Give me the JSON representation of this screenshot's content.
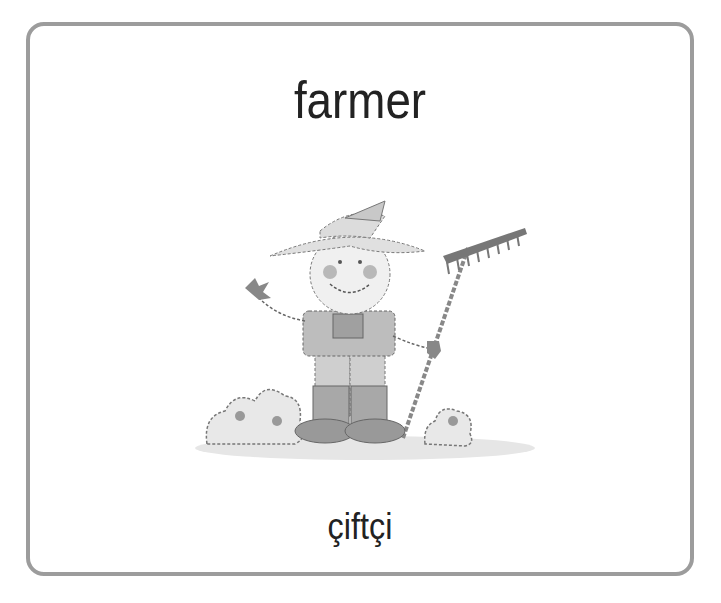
{
  "card": {
    "word_english": "farmer",
    "word_turkish": "çiftçi",
    "illustration": "farmer-with-rake",
    "border_color": "#9c9c9c"
  }
}
